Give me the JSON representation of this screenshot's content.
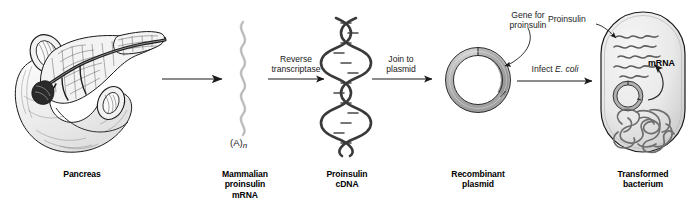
{
  "figure": {
    "background_color": "#ffffff",
    "ink_color": "#1a1a1a"
  },
  "stages": [
    {
      "id": "pancreas",
      "caption": "Pancreas",
      "icon": "pancreas-illustration"
    },
    {
      "id": "mrna",
      "caption_line1": "Mammalian",
      "caption_line2": "proinsulin",
      "caption_line3": "mRNA",
      "poly_a_tail": "(A)",
      "poly_a_subscript": "n",
      "icon": "mrna-strand"
    },
    {
      "id": "cdna",
      "caption_line1": "Proinsulin",
      "caption_line2": "cDNA",
      "icon": "dna-double-helix"
    },
    {
      "id": "plasmid",
      "caption_line1": "Recombinant",
      "caption_line2": "plasmid",
      "icon": "plasmid-ring",
      "callout_line1": "Gene for",
      "callout_line2": "proinsulin"
    },
    {
      "id": "bacterium",
      "caption_line1": "Transformed",
      "caption_line2": "bacterium",
      "icon": "bacterium-cell",
      "callout_proinsulin": "Proinsulin",
      "callout_mrna": "mRNA"
    }
  ],
  "arrows": [
    {
      "id": "arrow-1",
      "label_line1": "",
      "label_line2": ""
    },
    {
      "id": "arrow-2",
      "label_line1": "Reverse",
      "label_line2": "transcriptase"
    },
    {
      "id": "arrow-3",
      "label_line1": "Join to",
      "label_line2": "plasmid"
    },
    {
      "id": "arrow-4",
      "label_prefix": "Infect ",
      "label_italic": "E. coli"
    }
  ],
  "colors": {
    "outline": "#1a1a1a",
    "plasmid_fill": "#b8b8b8",
    "plasmid_gene_fill": "#9a9a9a",
    "bacterium_fill": "#e8e8e8",
    "mrna_strand": "#c9c9c9",
    "dna_helix": "#3a3a3a",
    "nucleoid": "#6b6b6b"
  }
}
